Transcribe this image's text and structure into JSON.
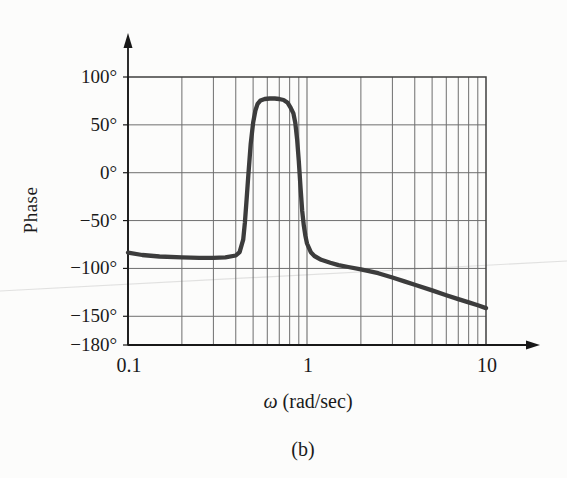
{
  "figure": {
    "ylabel": "Phase",
    "xlabel_omega": "ω",
    "xlabel_unit": " (rad/sec)",
    "xlabel_full": "ω (rad/sec)",
    "caption": "(b)"
  },
  "chart_data": {
    "type": "line",
    "title": "",
    "xlabel": "ω (rad/sec)",
    "ylabel": "Phase",
    "x_scale": "log",
    "xlim": [
      0.1,
      10
    ],
    "ylim": [
      -180,
      100
    ],
    "grid": true,
    "legend": "none",
    "colors": {
      "curve": "#3c3c3c",
      "grid": "#6e6e6e",
      "axis": "#181818",
      "background": "#fcfcfb"
    },
    "yticks": [
      {
        "value": 100,
        "label": "100°"
      },
      {
        "value": 50,
        "label": "50°"
      },
      {
        "value": 0,
        "label": "0°"
      },
      {
        "value": -50,
        "label": "−50°"
      },
      {
        "value": -100,
        "label": "−100°"
      },
      {
        "value": -150,
        "label": "−150°"
      },
      {
        "value": -180,
        "label": "−180°"
      }
    ],
    "xticks": [
      {
        "value": 0.1,
        "label": "0.1"
      },
      {
        "value": 1,
        "label": "1"
      },
      {
        "value": 10,
        "label": "10"
      }
    ],
    "series": [
      {
        "name": "phase-response",
        "points": [
          [
            0.1,
            -83.5
          ],
          [
            0.12,
            -86
          ],
          [
            0.15,
            -87.5
          ],
          [
            0.2,
            -88.5
          ],
          [
            0.25,
            -89
          ],
          [
            0.3,
            -89
          ],
          [
            0.35,
            -88.5
          ],
          [
            0.4,
            -86.5
          ],
          [
            0.42,
            -83
          ],
          [
            0.44,
            -70
          ],
          [
            0.45,
            -52
          ],
          [
            0.46,
            -28
          ],
          [
            0.47,
            -3
          ],
          [
            0.485,
            30
          ],
          [
            0.5,
            52
          ],
          [
            0.515,
            65
          ],
          [
            0.53,
            72
          ],
          [
            0.55,
            75.5
          ],
          [
            0.58,
            77
          ],
          [
            0.62,
            77.5
          ],
          [
            0.66,
            77.5
          ],
          [
            0.7,
            77
          ],
          [
            0.74,
            76
          ],
          [
            0.78,
            73
          ],
          [
            0.81,
            68
          ],
          [
            0.84,
            62
          ],
          [
            0.86,
            52
          ],
          [
            0.88,
            35
          ],
          [
            0.9,
            12
          ],
          [
            0.92,
            -15
          ],
          [
            0.94,
            -40
          ],
          [
            0.96,
            -55
          ],
          [
            0.98,
            -66
          ],
          [
            1.0,
            -74
          ],
          [
            1.05,
            -83
          ],
          [
            1.1,
            -87
          ],
          [
            1.2,
            -91
          ],
          [
            1.35,
            -94
          ],
          [
            1.5,
            -96.5
          ],
          [
            1.7,
            -98.5
          ],
          [
            2.0,
            -101
          ],
          [
            2.5,
            -105
          ],
          [
            3.0,
            -109.5
          ],
          [
            3.5,
            -113.5
          ],
          [
            4.0,
            -117
          ],
          [
            5.0,
            -123
          ],
          [
            6.0,
            -128
          ],
          [
            7.0,
            -132
          ],
          [
            8.0,
            -135.5
          ],
          [
            9.0,
            -138.5
          ],
          [
            10.0,
            -141.5
          ]
        ]
      }
    ]
  }
}
